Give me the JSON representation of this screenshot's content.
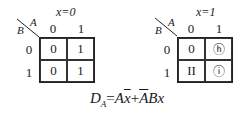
{
  "maps": [
    {
      "title": "x=0",
      "col_var": "A",
      "row_var": "B",
      "col_headers": [
        "0",
        "1"
      ],
      "row_headers": [
        "0",
        "1"
      ],
      "cells": [
        [
          "0",
          "1"
        ],
        [
          "0",
          "1"
        ]
      ]
    },
    {
      "title": "x=1",
      "col_var": "A",
      "row_var": "B",
      "col_headers": [
        "0",
        "1"
      ],
      "row_headers": [
        "0",
        "1"
      ],
      "cells": [
        [
          "0",
          "ⓗ"
        ],
        [
          "II",
          "ⓘ"
        ]
      ]
    }
  ],
  "formula": {
    "lhs": "D",
    "lhs_sub": "A",
    "equals": "=",
    "term1_a": "A",
    "term1_b": "x",
    "plus": "+",
    "term2_a": "A",
    "term2_b": "Bx"
  }
}
